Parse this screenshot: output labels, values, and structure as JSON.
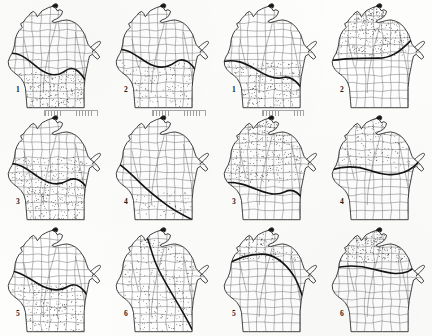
{
  "page": {
    "kind": "figure-plate",
    "columns": 4,
    "rows": 3,
    "ink_color": "#141414",
    "paper_color": "#fdfdfc",
    "stipple_color": "#2b2b2b",
    "county_line_color": "#6f6f6f"
  },
  "panels": [
    {
      "id": "panel-r1c1",
      "label": "1",
      "label_x": 16,
      "label_y": 86,
      "state": "Wisconsin",
      "isoline": "heavy sinuous line crossing from west-central to southeast",
      "stipple_region": "southern third",
      "stipple_density": "medium",
      "stipple_seed": 11
    },
    {
      "id": "panel-r1c2",
      "label": "2",
      "label_x": 16,
      "label_y": 86,
      "state": "Wisconsin",
      "isoline": "heavy line arcing across the middle of the state",
      "stipple_region": "southern half",
      "stipple_density": "light",
      "stipple_seed": 22
    },
    {
      "id": "panel-r1c3",
      "label": "1",
      "label_x": 16,
      "label_y": 86,
      "state": "Wisconsin",
      "isoline": "heavy line from northwest corner sweeping to the southeast",
      "stipple_region": "southwest and south-central",
      "stipple_density": "medium",
      "stipple_seed": 33
    },
    {
      "id": "panel-r1c4",
      "label": "2",
      "label_x": 16,
      "label_y": 86,
      "state": "Wisconsin",
      "isoline": "heavy line across the upper middle of the state",
      "stipple_region": "northern half",
      "stipple_density": "heavy",
      "stipple_seed": 44
    },
    {
      "id": "panel-r2c1",
      "label": "3",
      "label_x": 16,
      "label_y": 86,
      "state": "Wisconsin",
      "isoline": "heavy line across the central part of the state",
      "stipple_region": "southern two thirds",
      "stipple_density": "heavy",
      "stipple_seed": 55
    },
    {
      "id": "panel-r2c2",
      "label": "4",
      "label_x": 16,
      "label_y": 86,
      "state": "Wisconsin",
      "isoline": "heavy line running northwest to southeast",
      "stipple_region": "small patch in the south",
      "stipple_density": "very light",
      "stipple_seed": 66
    },
    {
      "id": "panel-r2c3",
      "label": "3",
      "label_x": 16,
      "label_y": 86,
      "state": "Wisconsin",
      "isoline": "heavy line across the lower third of the state",
      "stipple_region": "northern two thirds",
      "stipple_density": "heavy",
      "stipple_seed": 77
    },
    {
      "id": "panel-r2c4",
      "label": "4",
      "label_x": 16,
      "label_y": 86,
      "state": "Wisconsin",
      "isoline": "heavy line from west-central to east-central",
      "stipple_region": "northern half",
      "stipple_density": "light",
      "stipple_seed": 88
    },
    {
      "id": "panel-r3c1",
      "label": "5",
      "label_x": 16,
      "label_y": 86,
      "state": "Wisconsin",
      "isoline": "heavy line across the middle of the state",
      "stipple_region": "southern half",
      "stipple_density": "medium",
      "stipple_seed": 99
    },
    {
      "id": "panel-r3c2",
      "label": "6",
      "label_x": 16,
      "label_y": 86,
      "state": "Wisconsin",
      "isoline": "heavy line from north-central down the eastern side",
      "stipple_region": "most of the state",
      "stipple_density": "medium",
      "stipple_seed": 101
    },
    {
      "id": "panel-r3c3",
      "label": "5",
      "label_x": 16,
      "label_y": 86,
      "state": "Wisconsin",
      "isoline": "heavy arc across the north-central part of the state",
      "stipple_region": "far north and eastern edge",
      "stipple_density": "light",
      "stipple_seed": 111
    },
    {
      "id": "panel-r3c4",
      "label": "6",
      "label_x": 16,
      "label_y": 86,
      "state": "Wisconsin",
      "isoline": "heavy line across the upper third of the state",
      "stipple_region": "northern third",
      "stipple_density": "medium",
      "stipple_seed": 121
    }
  ],
  "rulers": [
    {
      "id": "ruler-r2c1",
      "x": 44,
      "y": 110,
      "width": 52
    },
    {
      "id": "ruler-r2c2",
      "x": 152,
      "y": 110,
      "width": 52
    },
    {
      "id": "ruler-r2c3",
      "x": 262,
      "y": 110,
      "width": 40
    }
  ]
}
